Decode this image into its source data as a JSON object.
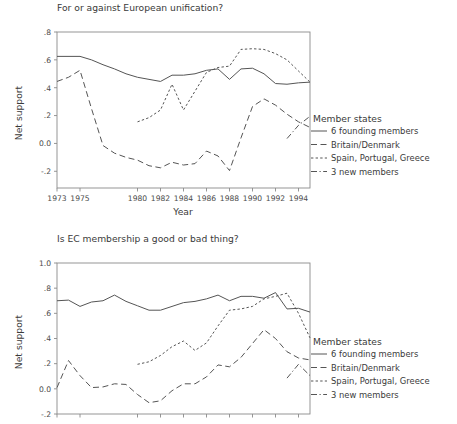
{
  "chart_data": [
    {
      "id": "top",
      "type": "line",
      "title": "For or against European unification?",
      "xlabel": "Year",
      "ylabel": "Net support",
      "xlim": [
        1973,
        1995
      ],
      "ylim": [
        -0.32,
        0.8
      ],
      "grid": false,
      "legend_position": "right",
      "legend_title": "Member states",
      "xticks": [
        1973,
        1975,
        1980,
        1982,
        1984,
        1986,
        1988,
        1990,
        1992,
        1994
      ],
      "xticklabels": [
        "1973",
        "1975",
        "1980",
        "1982",
        "1984",
        "1986",
        "1988",
        "1990",
        "1992",
        "1994"
      ],
      "yticks": [
        0.8,
        0.6,
        0.4,
        0.2,
        0.0,
        -0.2
      ],
      "yticklabels": [
        ".8",
        ".6",
        ".4",
        ".2",
        "0.0",
        "-.2"
      ],
      "series": [
        {
          "name": "6 founding members",
          "dash": "none",
          "x": [
            1973,
            1975,
            1976,
            1977,
            1978,
            1979,
            1980,
            1981,
            1982,
            1983,
            1984,
            1985,
            1986,
            1987,
            1988,
            1989,
            1990,
            1991,
            1992,
            1993,
            1994,
            1995
          ],
          "values": [
            0.625,
            0.625,
            0.6,
            0.565,
            0.535,
            0.5,
            0.475,
            0.46,
            0.445,
            0.49,
            0.49,
            0.5,
            0.525,
            0.535,
            0.46,
            0.535,
            0.54,
            0.5,
            0.43,
            0.425,
            0.435,
            0.44
          ]
        },
        {
          "name": "Britain/Denmark",
          "dash": "long",
          "x": [
            1973,
            1974,
            1975,
            1976,
            1977,
            1978,
            1979,
            1980,
            1981,
            1982,
            1983,
            1984,
            1985,
            1986,
            1987,
            1988,
            1989,
            1990,
            1991,
            1992,
            1993,
            1994,
            1995
          ],
          "values": [
            0.445,
            0.475,
            0.525,
            0.25,
            -0.015,
            -0.07,
            -0.1,
            -0.12,
            -0.16,
            -0.175,
            -0.135,
            -0.155,
            -0.145,
            -0.055,
            -0.09,
            -0.195,
            0.04,
            0.265,
            0.32,
            0.275,
            0.21,
            0.155,
            0.115
          ]
        },
        {
          "name": "Spain, Portugal, Greece",
          "dash": "short",
          "x": [
            1980,
            1981,
            1982,
            1983,
            1984,
            1985,
            1986,
            1987,
            1988,
            1989,
            1990,
            1991,
            1992,
            1993,
            1994,
            1995
          ],
          "values": [
            0.155,
            0.185,
            0.24,
            0.425,
            0.24,
            0.375,
            0.51,
            0.545,
            0.555,
            0.675,
            0.68,
            0.675,
            0.645,
            0.6,
            0.52,
            0.44
          ]
        },
        {
          "name": "3 new members",
          "dash": "dashdot",
          "x": [
            1993,
            1994,
            1995
          ],
          "values": [
            0.035,
            0.13,
            0.195
          ]
        }
      ]
    },
    {
      "id": "bottom",
      "type": "line",
      "title": "Is EC membership a good or bad thing?",
      "xlabel": "",
      "ylabel": "Net support",
      "xlim": [
        1973,
        1995
      ],
      "ylim": [
        -0.2,
        1.0
      ],
      "grid": false,
      "legend_position": "right",
      "legend_title": "Member states",
      "xticks": [
        1973,
        1975,
        1980,
        1982,
        1984,
        1986,
        1988,
        1990,
        1992,
        1994
      ],
      "xticklabels": [
        "",
        "",
        "",
        "",
        "",
        "",
        "",
        "",
        "",
        ""
      ],
      "yticks": [
        1.0,
        0.8,
        0.6,
        0.4,
        0.2,
        0.0,
        -0.2
      ],
      "yticklabels": [
        "1.0",
        ".8",
        ".6",
        ".4",
        ".2",
        "0.0",
        "-.2"
      ],
      "series": [
        {
          "name": "6 founding members",
          "dash": "none",
          "x": [
            1973,
            1974,
            1975,
            1976,
            1977,
            1978,
            1979,
            1980,
            1981,
            1982,
            1983,
            1984,
            1985,
            1986,
            1987,
            1988,
            1989,
            1990,
            1991,
            1992,
            1993,
            1994,
            1995
          ],
          "values": [
            0.7,
            0.705,
            0.655,
            0.69,
            0.7,
            0.745,
            0.695,
            0.66,
            0.625,
            0.625,
            0.655,
            0.685,
            0.695,
            0.715,
            0.745,
            0.7,
            0.735,
            0.735,
            0.72,
            0.765,
            0.635,
            0.64,
            0.61
          ]
        },
        {
          "name": "Britain/Denmark",
          "dash": "long",
          "x": [
            1973,
            1974,
            1975,
            1976,
            1977,
            1978,
            1979,
            1980,
            1981,
            1982,
            1983,
            1984,
            1985,
            1986,
            1987,
            1988,
            1989,
            1990,
            1991,
            1992,
            1993,
            1994,
            1995
          ],
          "values": [
            0.01,
            0.225,
            0.105,
            0.01,
            0.015,
            0.04,
            0.035,
            -0.045,
            -0.11,
            -0.095,
            -0.015,
            0.04,
            0.04,
            0.095,
            0.19,
            0.175,
            0.25,
            0.36,
            0.47,
            0.4,
            0.295,
            0.245,
            0.23
          ]
        },
        {
          "name": "Spain, Portugal, Greece",
          "dash": "short",
          "x": [
            1980,
            1981,
            1982,
            1983,
            1984,
            1985,
            1986,
            1987,
            1988,
            1989,
            1990,
            1991,
            1992,
            1993,
            1994,
            1995
          ],
          "values": [
            0.195,
            0.215,
            0.265,
            0.335,
            0.38,
            0.305,
            0.365,
            0.5,
            0.625,
            0.635,
            0.655,
            0.715,
            0.735,
            0.76,
            0.6,
            0.405
          ]
        },
        {
          "name": "3 new members",
          "dash": "dashdot",
          "x": [
            1993,
            1994,
            1995
          ],
          "values": [
            0.085,
            0.195,
            0.105
          ]
        }
      ]
    }
  ],
  "top": {
    "title": "For or against European unification?",
    "ylabel": "Net support",
    "xlabel": "Year",
    "legend": {
      "title": "Member states",
      "items": [
        {
          "label": "6 founding members"
        },
        {
          "label": "Britain/Denmark"
        },
        {
          "label": "Spain, Portugal, Greece"
        },
        {
          "label": "3 new members"
        }
      ]
    }
  },
  "bottom": {
    "title": "Is EC membership a good or bad thing?",
    "ylabel": "Net support",
    "xlabel": "",
    "legend": {
      "title": "Member states",
      "items": [
        {
          "label": "6 founding members"
        },
        {
          "label": "Britain/Denmark"
        },
        {
          "label": "Spain, Portugal, Greece"
        },
        {
          "label": "3 new members"
        }
      ]
    }
  },
  "colors": {
    "line": "#555555",
    "axis": "#8a8a8a",
    "text": "#3a3a3a",
    "background": "#ffffff"
  }
}
